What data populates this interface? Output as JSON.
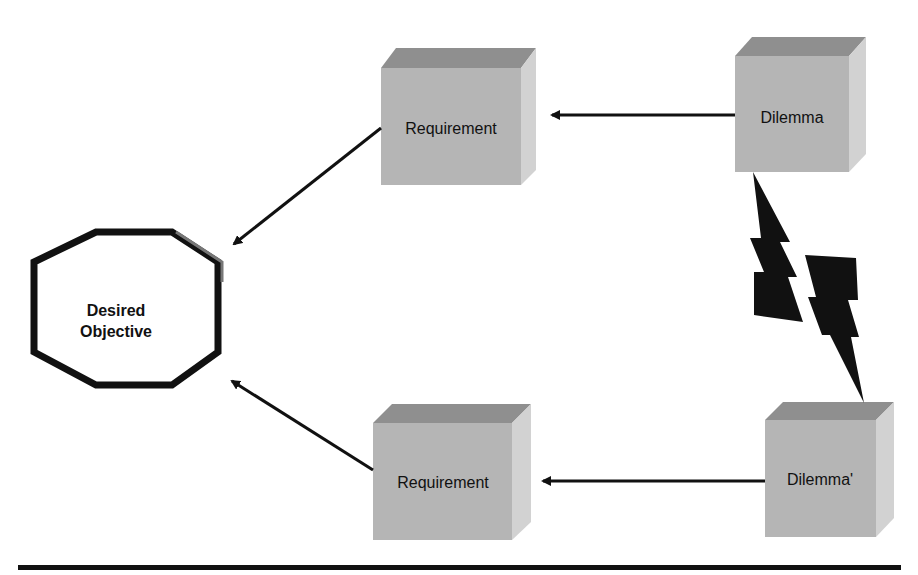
{
  "diagram": {
    "objective": {
      "line1": "Desired",
      "line2": "Objective"
    },
    "boxes": [
      {
        "id": "req-top",
        "label": "Requirement"
      },
      {
        "id": "dil-top",
        "label": "Dilemma"
      },
      {
        "id": "req-bottom",
        "label": "Requirement"
      },
      {
        "id": "dil-bottom",
        "label": "Dilemma'"
      }
    ],
    "connectors": [
      {
        "from": "Dilemma",
        "to": "Requirement (top)"
      },
      {
        "from": "Requirement (top)",
        "to": "Desired Objective"
      },
      {
        "from": "Dilemma'",
        "to": "Requirement (bottom)"
      },
      {
        "from": "Requirement (bottom)",
        "to": "Desired Objective"
      },
      {
        "from": "Dilemma",
        "to": "Dilemma'",
        "type": "conflict-lightning"
      }
    ],
    "colors": {
      "box_front": "#b3b3b3",
      "box_top": "#8f8f8f",
      "box_side": "#cfcfcf",
      "stroke": "#111111"
    }
  }
}
